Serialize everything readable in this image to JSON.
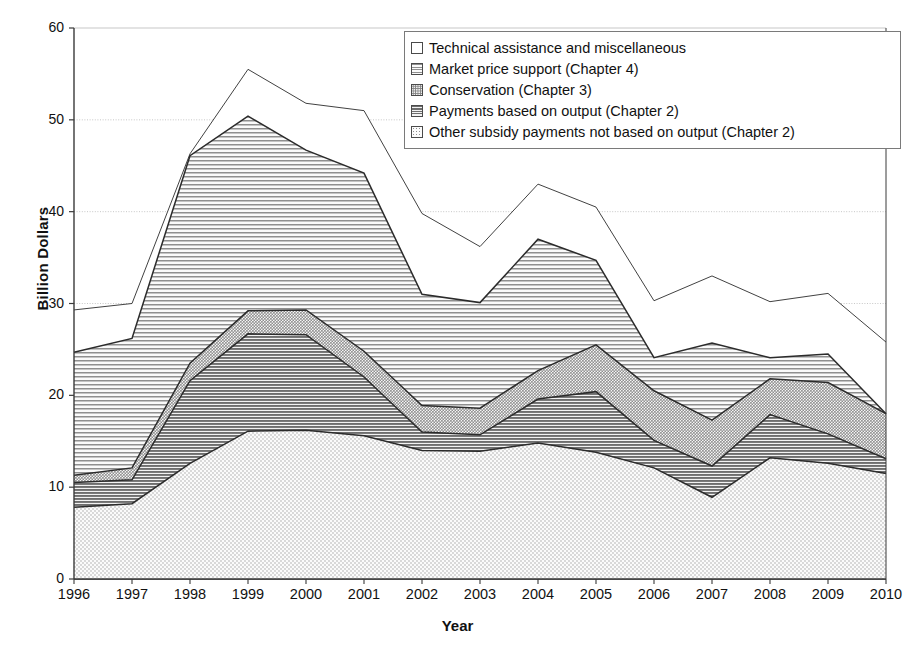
{
  "chart_data": {
    "type": "area",
    "stacked": true,
    "title": "",
    "xlabel": "Year",
    "ylabel": "Billion Dollars",
    "x": [
      1996,
      1997,
      1998,
      1999,
      2000,
      2001,
      2002,
      2003,
      2004,
      2005,
      2006,
      2007,
      2008,
      2009,
      2010
    ],
    "xtick_labels": [
      "1996",
      "1997",
      "1998",
      "1999",
      "2000",
      "2001",
      "2002",
      "2003",
      "2004",
      "2005",
      "2006",
      "2007",
      "2008",
      "2009",
      "2010"
    ],
    "ytick_labels": [
      "0",
      "10",
      "20",
      "30",
      "40",
      "50",
      "60"
    ],
    "yticks": [
      0,
      10,
      20,
      30,
      40,
      50,
      60
    ],
    "ylim": [
      0,
      60
    ],
    "grid": true,
    "legend_position": "top-right",
    "series": [
      {
        "name": "Other subsidy payments not based on output (Chapter 2)",
        "pattern": "light-dots",
        "values": [
          7.8,
          8.2,
          12.6,
          16.1,
          16.2,
          15.6,
          14.0,
          13.9,
          14.8,
          13.8,
          12.1,
          8.9,
          13.2,
          12.6,
          11.5
        ]
      },
      {
        "name": "Payments based on output (Chapter 2)",
        "pattern": "dark-horizontal-lines",
        "values": [
          2.7,
          2.6,
          9.0,
          10.6,
          10.4,
          6.4,
          2.0,
          1.8,
          4.8,
          6.6,
          3.0,
          3.4,
          4.7,
          3.2,
          1.6
        ]
      },
      {
        "name": "Conservation (Chapter 3)",
        "pattern": "medium-crosshatch",
        "values": [
          0.8,
          1.3,
          1.9,
          2.5,
          2.7,
          2.8,
          2.9,
          2.9,
          3.1,
          5.1,
          5.4,
          5.0,
          3.9,
          5.6,
          4.9
        ]
      },
      {
        "name": "Market price support (Chapter 4)",
        "pattern": "light-horizontal-lines",
        "values": [
          13.4,
          14.1,
          22.6,
          21.2,
          17.4,
          19.4,
          12.1,
          11.5,
          14.3,
          9.2,
          3.6,
          8.4,
          2.3,
          3.1,
          0.0
        ]
      },
      {
        "name": "Technical assistance and miscellaneous",
        "pattern": "white",
        "values": [
          4.6,
          3.8,
          0.2,
          5.1,
          5.1,
          6.8,
          8.8,
          6.1,
          6.0,
          5.8,
          6.2,
          7.3,
          6.1,
          6.6,
          7.8
        ]
      }
    ],
    "stack_tops": {
      "other_subsidy": [
        7.8,
        8.2,
        12.6,
        16.1,
        16.2,
        15.6,
        14.0,
        13.9,
        14.8,
        13.8,
        12.1,
        8.9,
        13.2,
        12.6,
        11.5
      ],
      "payments_output": [
        10.5,
        10.8,
        21.6,
        26.7,
        26.6,
        22.0,
        16.0,
        15.7,
        19.6,
        20.4,
        15.1,
        12.3,
        17.9,
        15.8,
        13.1
      ],
      "conservation": [
        11.3,
        12.1,
        23.5,
        29.2,
        29.3,
        24.8,
        18.9,
        18.6,
        22.7,
        25.5,
        20.5,
        17.3,
        21.8,
        21.4,
        18.0
      ],
      "market_price": [
        24.7,
        26.2,
        46.1,
        50.4,
        46.7,
        44.2,
        31.0,
        30.1,
        37.0,
        34.7,
        24.1,
        25.7,
        24.1,
        24.5,
        18.0
      ],
      "total": [
        29.3,
        30.0,
        46.3,
        55.5,
        51.8,
        51.0,
        39.8,
        36.2,
        43.0,
        40.5,
        30.3,
        33.0,
        30.2,
        31.1,
        25.8
      ]
    }
  },
  "legend": {
    "items": [
      {
        "label": "Technical assistance and miscellaneous",
        "pattern": "white"
      },
      {
        "label": "Market price support (Chapter 4)",
        "pattern": "light-horizontal-lines"
      },
      {
        "label": "Conservation (Chapter 3)",
        "pattern": "medium-crosshatch"
      },
      {
        "label": "Payments based on output (Chapter 2)",
        "pattern": "dark-horizontal-lines"
      },
      {
        "label": "Other subsidy payments not based on output (Chapter 2)",
        "pattern": "light-dots"
      }
    ]
  },
  "colors": {
    "axis": "#3a3a3a",
    "grid": "#b9b9b9",
    "line": "#2b2b2b",
    "text": "#111111",
    "plot_background": "#ffffff"
  }
}
